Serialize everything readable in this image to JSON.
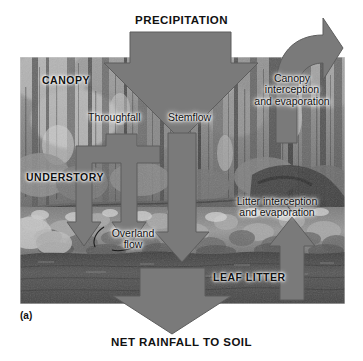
{
  "figure": {
    "panel_label": "(a)",
    "type": "forest-hydrology-water-balance-diagram",
    "background": "grayscale forest photograph"
  },
  "headings": {
    "precipitation": "PRECIPITATION",
    "net_rainfall": "NET RAINFALL TO SOIL"
  },
  "layers": {
    "canopy": "CANOPY",
    "understory": "UNDERSTORY",
    "leaf_litter": "LEAF LITTER"
  },
  "flows": {
    "throughfall": "Throughfall",
    "stemflow": "Stemflow",
    "overland_flow": "Overland\nflow",
    "canopy_interception": "Canopy\ninterception\nand evaporation",
    "litter_interception": "Litter interception\nand evaporation"
  },
  "colors": {
    "arrow_fill": "#7a7a7a",
    "arrow_stroke": "#5d5d5d",
    "text": "#111111",
    "page_background": "#ffffff",
    "soil_band": "#4a4a4a"
  },
  "arrows": [
    {
      "name": "precipitation-arrow",
      "direction": "down",
      "label": "PRECIPITATION"
    },
    {
      "name": "canopy-interception-arrow",
      "direction": "up-curved",
      "label": "Canopy interception and evaporation"
    },
    {
      "name": "throughfall-arrow",
      "direction": "down-forked",
      "label": "Throughfall"
    },
    {
      "name": "stemflow-arrow",
      "direction": "down",
      "label": "Stemflow"
    },
    {
      "name": "litter-interception-arrow",
      "direction": "up",
      "label": "Litter interception and evaporation"
    },
    {
      "name": "net-rainfall-arrow",
      "direction": "down",
      "label": "NET RAINFALL TO SOIL"
    }
  ]
}
